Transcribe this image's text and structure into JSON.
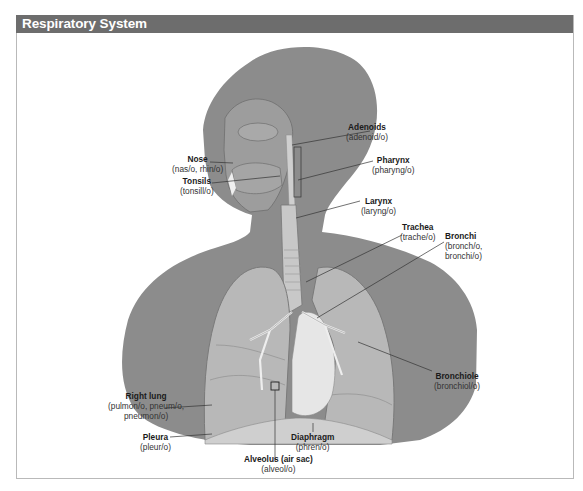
{
  "header": {
    "title": "Respiratory System"
  },
  "labels": [
    {
      "id": "adenoids",
      "term": "Adenoids",
      "roots": [
        "(adenoid/o)"
      ]
    },
    {
      "id": "nose",
      "term": "Nose",
      "roots": [
        "(nas/o, rhin/o)"
      ]
    },
    {
      "id": "pharynx",
      "term": "Pharynx",
      "roots": [
        "(pharyng/o)"
      ]
    },
    {
      "id": "tonsils",
      "term": "Tonsils",
      "roots": [
        "(tonsill/o)"
      ]
    },
    {
      "id": "larynx",
      "term": "Larynx",
      "roots": [
        "(laryng/o)"
      ]
    },
    {
      "id": "trachea",
      "term": "Trachea",
      "roots": [
        "(trache/o)"
      ]
    },
    {
      "id": "bronchi",
      "term": "Bronchi",
      "roots": [
        "(bronch/o,",
        "bronchi/o)"
      ]
    },
    {
      "id": "bronchiole",
      "term": "Bronchiole",
      "roots": [
        "(bronchiol/o)"
      ]
    },
    {
      "id": "right_lung",
      "term": "Right lung",
      "roots": [
        "(pulmon/o, pneum/o,",
        "pneumon/o)"
      ]
    },
    {
      "id": "pleura",
      "term": "Pleura",
      "roots": [
        "(pleur/o)"
      ]
    },
    {
      "id": "diaphragm",
      "term": "Diaphragm",
      "roots": [
        "(phren/o)"
      ]
    },
    {
      "id": "alveolus",
      "term": "Alveolus (air sac)",
      "roots": [
        "(alveol/o)"
      ]
    }
  ],
  "colors": {
    "title_bar": "#6d6d6d",
    "silhouette": "#8c8c8c",
    "lung": "#b8b8b8",
    "heart": "#e6e6e6",
    "leader_line": "#333333"
  }
}
